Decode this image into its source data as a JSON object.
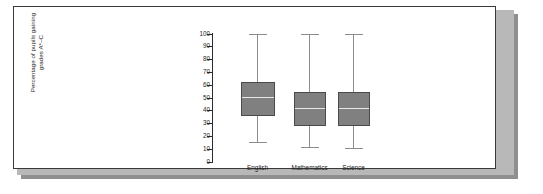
{
  "figure": {
    "background_color": "#ffffff",
    "frame_color": "#3a3a3a",
    "shadow_color": "#8f8f8f"
  },
  "chart_data": {
    "type": "box",
    "title": "",
    "xlabel": "",
    "ylabel": "Percentage of pupils gaining\ngrades A*–C",
    "ylabel_line1": "Percentage of pupils gaining",
    "ylabel_line2": "grades A*–C",
    "categories": [
      "English",
      "Mathematics",
      "Science"
    ],
    "ylim": [
      0,
      100
    ],
    "ytick_labels": [
      "0",
      "10",
      "20",
      "30",
      "40",
      "50",
      "60",
      "70",
      "80",
      "90",
      "100"
    ],
    "yticks": [
      0,
      10,
      20,
      30,
      40,
      50,
      60,
      70,
      80,
      90,
      100
    ],
    "grid": false,
    "legend": null,
    "box_fill_color": "#808080",
    "box_edge_color": "#4a4a4a",
    "median_color": "#e8e8e8",
    "whisker_color": "#8c8c8c",
    "boxes": [
      {
        "category": "English",
        "min": 15.0,
        "q1": 35.5,
        "median": 50.0,
        "q3": 62.5,
        "max": 100
      },
      {
        "category": "Mathematics",
        "min": 11.0,
        "q1": 28.0,
        "median": 41.5,
        "q3": 54.5,
        "max": 100
      },
      {
        "category": "Science",
        "min": 10.5,
        "q1": 28.0,
        "median": 41.5,
        "q3": 54.5,
        "max": 100
      }
    ]
  }
}
